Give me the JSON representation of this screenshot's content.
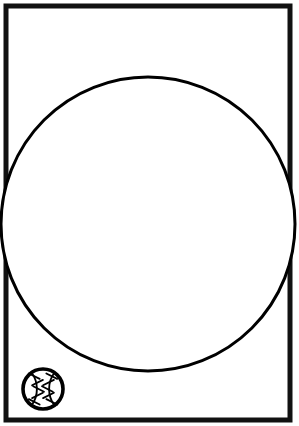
{
  "page": {
    "title": "Baseball Coloring Page",
    "width": 299,
    "height": 426,
    "background_color": "#ffffff",
    "ink_color": "#000000"
  },
  "frame": {
    "name": "page-border",
    "x": 6,
    "y": 6,
    "width": 284,
    "height": 414,
    "stroke_width": 5,
    "stroke_color": "#111111",
    "fill_color": "#ffffff"
  },
  "main_circle": {
    "name": "large-ball-outline",
    "label": "Large blank ball outline",
    "center_x": 148,
    "center_y": 224,
    "radius": 147,
    "stroke_width": 3,
    "stroke_color": "#000000",
    "fill_color": "#ffffff"
  },
  "reference_icon": {
    "name": "baseball-icon",
    "label": "Baseball reference icon",
    "center_x": 43,
    "center_y": 389,
    "radius": 20,
    "stroke_width": 3.6,
    "stroke_color": "#000000",
    "fill_color": "#ffffff",
    "seam_count": 2,
    "stitch_count_per_seam": 5
  }
}
